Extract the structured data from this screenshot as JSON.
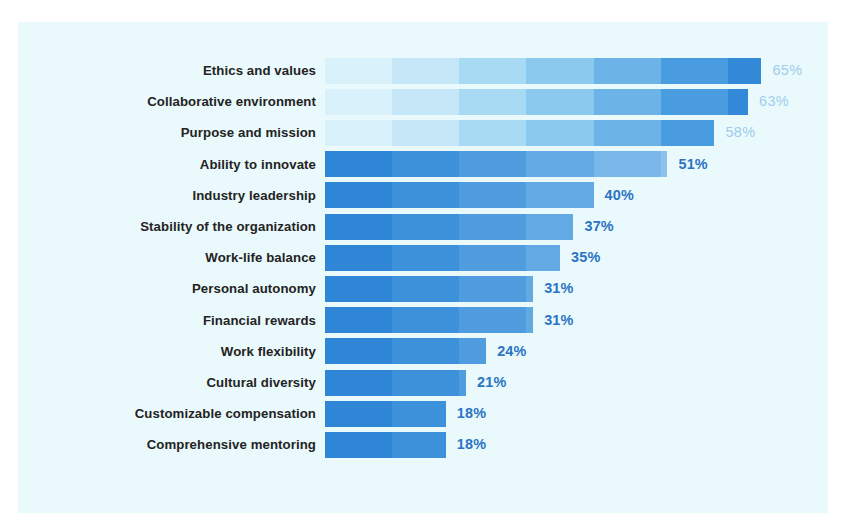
{
  "figure": {
    "background_color": "#ffffff",
    "panel_color": "#eaf9fb",
    "label_color": "#232323",
    "value_color_light": "#9ecdee",
    "value_color_dark": "#2a74c4"
  },
  "chart_data": {
    "type": "bar",
    "orientation": "horizontal",
    "title": "",
    "subtitle": "",
    "xlabel": "",
    "ylabel": "",
    "grid": false,
    "legend": "none",
    "xlim": [
      0,
      70
    ],
    "value_suffix": "%",
    "categories": [
      "Ethics and values",
      "Collaborative environment",
      "Purpose and mission",
      "Ability to innovate",
      "Industry leadership",
      "Stability of the organization",
      "Work-life balance",
      "Personal autonomy",
      "Financial rewards",
      "Work flexibility",
      "Cultural diversity",
      "Customizable compensation",
      "Comprehensive mentoring"
    ],
    "values": [
      65,
      63,
      58,
      51,
      40,
      37,
      35,
      31,
      31,
      24,
      21,
      18,
      18
    ],
    "value_labels": [
      "65%",
      "63%",
      "58%",
      "51%",
      "40%",
      "37%",
      "35%",
      "31%",
      "31%",
      "24%",
      "21%",
      "18%",
      "18%"
    ],
    "label_styles": [
      "light",
      "light",
      "light",
      "dark",
      "dark",
      "dark",
      "dark",
      "dark",
      "dark",
      "dark",
      "dark",
      "dark",
      "dark"
    ],
    "band_palette_light_to_dark": [
      "#d9f1fb",
      "#c5e7f8",
      "#a9daf4",
      "#8cc9ef",
      "#6cb4e8",
      "#4a9ce0",
      "#3189d8"
    ],
    "band_palette_dark_to_light": [
      "#2f86d6",
      "#3d90da",
      "#4f9cdf",
      "#63a9e4",
      "#79b6e9",
      "#8cc2ed",
      "#9ecdf0"
    ],
    "band_direction_per_row": [
      "light-to-dark",
      "light-to-dark",
      "light-to-dark",
      "dark-to-light",
      "dark-to-light",
      "dark-to-light",
      "dark-to-light",
      "dark-to-light",
      "dark-to-light",
      "dark-to-light",
      "dark-to-light",
      "dark-to-light",
      "dark-to-light"
    ]
  }
}
